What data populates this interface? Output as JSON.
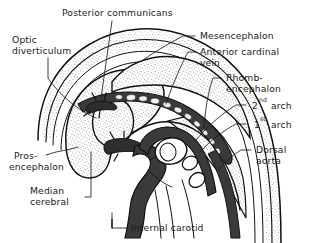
{
  "figure": {
    "kind": "anatomical-line-drawing",
    "background_color": "#ffffff",
    "ink_color": "#111111",
    "stipple_color": "#5a5a5a",
    "vessel_fill_color": "#3b3b3b"
  },
  "labels": {
    "posterior_communicans": "Posterior communicans",
    "optic_diverticulum_line1": "Optic",
    "optic_diverticulum_line2": "diverticulum",
    "mesencephalon": "Mesencephalon",
    "anterior_cardinal_vein_line1": "Anterior cardinal",
    "anterior_cardinal_vein_line2": "vein",
    "rhombencephalon_line1": "Rhomb-",
    "rhombencephalon_line2": "encephalon",
    "second_arch_num": "2",
    "second_arch_sup": "nd",
    "second_arch_word": "arch",
    "first_arch_num": "1",
    "first_arch_sup": "st",
    "first_arch_word": "arch",
    "dorsal_aorta_line1": "Dorsal",
    "dorsal_aorta_line2": "aorta",
    "prosencephalon_line1": "Pros-",
    "prosencephalon_line2": "encephalon",
    "median_cerebral_line1": "Median",
    "median_cerebral_line2": "cerebral",
    "internal_carotid": "Internal carotid"
  },
  "structures": [
    {
      "name": "prosencephalon",
      "type": "brain-vesicle",
      "texture": "stippled"
    },
    {
      "name": "mesencephalon",
      "type": "brain-vesicle",
      "texture": "stippled"
    },
    {
      "name": "rhombencephalon",
      "type": "brain-vesicle",
      "texture": "stippled"
    },
    {
      "name": "optic-diverticulum",
      "type": "brain-outgrowth",
      "texture": "stippled"
    },
    {
      "name": "anterior-cardinal-vein",
      "type": "vein",
      "texture": "dark-with-lumen-cells"
    },
    {
      "name": "internal-carotid",
      "type": "artery",
      "texture": "solid-dark"
    },
    {
      "name": "dorsal-aorta",
      "type": "artery",
      "texture": "solid-dark"
    },
    {
      "name": "posterior-communicans",
      "type": "artery",
      "texture": "solid-dark"
    },
    {
      "name": "median-cerebral",
      "type": "artery",
      "texture": "solid-dark"
    },
    {
      "name": "first-pharyngeal-arch",
      "type": "pharyngeal-arch",
      "texture": "outline-oval"
    },
    {
      "name": "second-pharyngeal-arch",
      "type": "pharyngeal-arch",
      "texture": "outline-oval"
    }
  ]
}
